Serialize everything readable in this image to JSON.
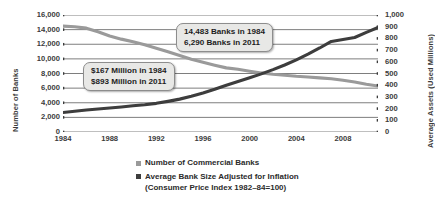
{
  "chart_data": {
    "type": "line",
    "title": "",
    "xlabel": "",
    "ylabel": "Number of Banks",
    "y2label": "Average Assets (Used Millions)",
    "grid": true,
    "legend_position": "bottom",
    "xlim": [
      1984,
      2011
    ],
    "ylim": [
      0,
      16000
    ],
    "y2lim": [
      0,
      1000
    ],
    "xticks": [
      "1984",
      "1988",
      "1992",
      "1996",
      "2000",
      "2004",
      "2008"
    ],
    "xtick_values": [
      1984,
      1988,
      1992,
      1996,
      2000,
      2004,
      2008
    ],
    "yticks": [
      "0",
      "2,000",
      "4,000",
      "6,000",
      "8,000",
      "10,000",
      "12,000",
      "14,000",
      "16,000"
    ],
    "ytick_values": [
      0,
      2000,
      4000,
      6000,
      8000,
      10000,
      12000,
      14000,
      16000
    ],
    "y2ticks": [
      "0",
      "100",
      "200",
      "300",
      "400",
      "500",
      "600",
      "700",
      "800",
      "900",
      "1,000"
    ],
    "y2tick_values": [
      0,
      100,
      200,
      300,
      400,
      500,
      600,
      700,
      800,
      900,
      1000
    ],
    "series": [
      {
        "name": "Number of Commercial Banks",
        "axis": "left",
        "color": "#9a9a9a",
        "x": [
          1984,
          1985,
          1986,
          1987,
          1988,
          1989,
          1990,
          1991,
          1992,
          1993,
          1994,
          1995,
          1996,
          1997,
          1998,
          1999,
          2000,
          2001,
          2002,
          2003,
          2004,
          2005,
          2006,
          2007,
          2008,
          2009,
          2010,
          2011
        ],
        "values": [
          14483,
          14400,
          14200,
          13700,
          13120,
          12700,
          12340,
          11920,
          11460,
          10960,
          10450,
          9940,
          9530,
          9140,
          8770,
          8580,
          8315,
          8080,
          7890,
          7770,
          7630,
          7525,
          7400,
          7280,
          7085,
          6840,
          6530,
          6290
        ]
      },
      {
        "name": "Average Bank Size Adjusted for Inflation",
        "axis": "right",
        "color": "#3d3d3d",
        "x": [
          1984,
          1985,
          1986,
          1987,
          1988,
          1989,
          1990,
          1991,
          1992,
          1993,
          1994,
          1995,
          1996,
          1997,
          1998,
          1999,
          2000,
          2001,
          2002,
          2003,
          2004,
          2005,
          2006,
          2007,
          2008,
          2009,
          2010,
          2011
        ],
        "values": [
          167,
          178,
          188,
          196,
          205,
          214,
          224,
          233,
          245,
          262,
          281,
          305,
          333,
          365,
          400,
          432,
          464,
          497,
          533,
          573,
          617,
          665,
          718,
          774,
          790,
          808,
          852,
          893
        ]
      }
    ],
    "annotations": [
      {
        "name": "banks-callout",
        "lines": [
          "14,483 Banks in 1984",
          "6,290 Banks in 2011"
        ],
        "target_series": "Number of Commercial Banks"
      },
      {
        "name": "bank-size-callout",
        "lines": [
          "$167 Million in 1984",
          "$893 Million in 2011"
        ],
        "target_series": "Average Bank Size Adjusted for Inflation"
      }
    ],
    "legend": [
      {
        "label": "Number of Commercial Banks",
        "sublabel": "",
        "color": "#9a9a9a"
      },
      {
        "label": "Average Bank Size Adjusted for Inflation",
        "sublabel": "(Consumer Price Index 1982–84=100)",
        "color": "#3d3d3d"
      }
    ]
  },
  "colors": {
    "background": "#ffffff",
    "gridline": "#6f6f6f",
    "axis_text": "#3b3b3b",
    "series_banks": "#9a9a9a",
    "series_size": "#3d3d3d",
    "callout_fill": "#e8e8e6",
    "callout_border": "#8d8d8d"
  }
}
